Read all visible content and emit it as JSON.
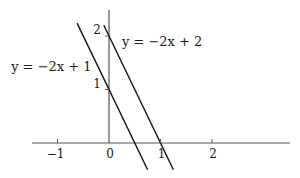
{
  "chart_data": {
    "type": "line",
    "title": "",
    "xlabel": "",
    "ylabel": "",
    "xlim": [
      -1.5,
      3.5
    ],
    "ylim": [
      -0.5,
      2.5
    ],
    "grid": false,
    "x_ticks": [
      {
        "value": -1,
        "label": "−1"
      },
      {
        "value": 0,
        "label": "0"
      },
      {
        "value": 1,
        "label": "1"
      },
      {
        "value": 2,
        "label": "2"
      }
    ],
    "y_ticks": [
      {
        "value": 1,
        "label": "1"
      },
      {
        "value": 2,
        "label": "2"
      }
    ],
    "series": [
      {
        "name": "y = −2x + 1",
        "slope": -2,
        "intercept": 1,
        "x": [
          -0.62,
          0.75
        ],
        "y": [
          2.24,
          -0.5
        ]
      },
      {
        "name": "y = −2x + 2",
        "slope": -2,
        "intercept": 2,
        "x": [
          -0.1,
          1.25
        ],
        "y": [
          2.2,
          -0.5
        ]
      }
    ],
    "annotations": [
      {
        "text": "y = −2x + 1",
        "anchor_x": -1.9,
        "anchor_y": 1.35
      },
      {
        "text": "y = −2x + 2",
        "anchor_x": 0.25,
        "anchor_y": 1.82
      }
    ]
  }
}
